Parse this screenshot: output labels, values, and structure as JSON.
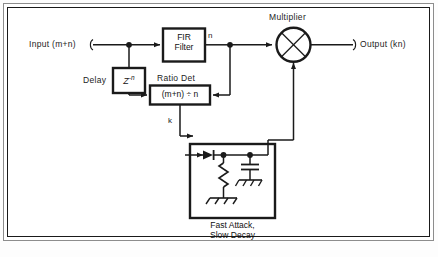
{
  "diagram": {
    "title_hidden": "",
    "type": "block-diagram",
    "signals": {
      "input_label": "Input (m+n)",
      "output_label": "Output (kn)",
      "fir_output_label": "n",
      "ratio_output_label": "k"
    },
    "blocks": {
      "fir": {
        "line1": "FIR",
        "line2": "Filter"
      },
      "delay": {
        "caption": "Delay",
        "symbol_base": "Z",
        "symbol_exp": "-n"
      },
      "ratio_det": {
        "caption": "Ratio Det",
        "expression": "(m+n) ÷ n"
      },
      "multiplier": {
        "caption": "Multiplier",
        "symbol": "×"
      },
      "envelope": {
        "caption_line1": "Fast Attack,",
        "caption_line2": "Slow Decay",
        "components": [
          {
            "name": "diode",
            "symbol": "diode"
          },
          {
            "name": "resistor",
            "symbol": "zigzag-resistor"
          },
          {
            "name": "capacitor",
            "symbol": "parallel-plate-capacitor"
          },
          {
            "name": "ground",
            "symbol": "ground-rake"
          }
        ]
      }
    },
    "colors": {
      "line": "#1a1a1a",
      "frame_outer": "#8d8d8d",
      "frame_inner": "#1a1a1a",
      "background": "#ffffff",
      "text": "#1c1c1c"
    }
  }
}
